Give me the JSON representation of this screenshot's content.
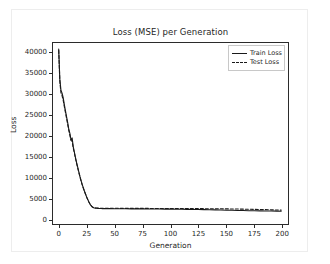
{
  "chart_data": {
    "type": "line",
    "title": "Loss (MSE) per Generation",
    "xlabel": "Generation",
    "ylabel": "Loss",
    "xlim": [
      -6,
      206
    ],
    "ylim": [
      -1200,
      42500
    ],
    "xticks": [
      0,
      25,
      50,
      75,
      100,
      125,
      150,
      175,
      200
    ],
    "yticks": [
      0,
      5000,
      10000,
      15000,
      20000,
      25000,
      30000,
      35000,
      40000
    ],
    "grid": false,
    "legend_position": "upper right",
    "x": [
      0,
      1,
      2,
      3,
      4,
      5,
      6,
      7,
      8,
      9,
      10,
      11,
      12,
      13,
      14,
      15,
      16,
      17,
      18,
      19,
      20,
      21,
      22,
      23,
      24,
      25,
      26,
      27,
      28,
      29,
      30,
      31,
      32,
      33,
      34,
      35,
      36,
      37,
      38,
      39,
      40,
      45,
      50,
      55,
      60,
      65,
      70,
      75,
      80,
      85,
      90,
      95,
      100,
      105,
      110,
      115,
      120,
      125,
      130,
      135,
      140,
      145,
      150,
      155,
      160,
      165,
      170,
      175,
      180,
      185,
      190,
      195,
      199
    ],
    "series": [
      {
        "name": "Train Loss",
        "style": "solid",
        "color": "#1a1a1a",
        "values": [
          40800,
          33600,
          31000,
          30300,
          29200,
          27600,
          26100,
          24700,
          23300,
          21700,
          20700,
          19100,
          19600,
          17500,
          16200,
          14900,
          13700,
          12600,
          11500,
          10400,
          9400,
          8500,
          7700,
          6900,
          6200,
          5500,
          4900,
          4300,
          3800,
          3400,
          3100,
          2950,
          2870,
          2820,
          2790,
          2770,
          2750,
          2740,
          2730,
          2720,
          2710,
          2700,
          2690,
          2680,
          2670,
          2660,
          2650,
          2640,
          2630,
          2620,
          2610,
          2600,
          2590,
          2570,
          2550,
          2530,
          2510,
          2490,
          2460,
          2430,
          2400,
          2370,
          2340,
          2310,
          2280,
          2250,
          2220,
          2200,
          2180,
          2160,
          2140,
          2120,
          2100
        ]
      },
      {
        "name": "Test Loss",
        "style": "dashed",
        "color": "#1a1a1a",
        "values": [
          40500,
          33100,
          30400,
          29700,
          28600,
          27100,
          25700,
          24300,
          22900,
          21400,
          20200,
          19000,
          18800,
          17200,
          16000,
          14700,
          13500,
          12400,
          11300,
          10300,
          9300,
          8400,
          7600,
          6850,
          6150,
          5450,
          4850,
          4280,
          3800,
          3420,
          3150,
          3000,
          2930,
          2880,
          2850,
          2830,
          2820,
          2810,
          2800,
          2800,
          2800,
          2790,
          2790,
          2780,
          2780,
          2770,
          2770,
          2760,
          2760,
          2755,
          2750,
          2745,
          2740,
          2735,
          2730,
          2725,
          2720,
          2715,
          2700,
          2690,
          2680,
          2670,
          2650,
          2630,
          2610,
          2590,
          2560,
          2530,
          2500,
          2460,
          2420,
          2380,
          2350
        ]
      }
    ]
  },
  "legend": {
    "items": [
      {
        "label": "Train Loss",
        "style": "solid"
      },
      {
        "label": "Test Loss",
        "style": "dashed"
      }
    ]
  }
}
